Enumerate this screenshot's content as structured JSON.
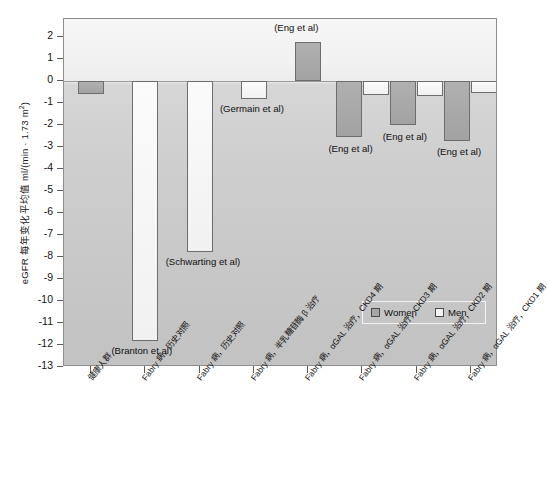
{
  "chart_data": {
    "type": "bar",
    "title": "",
    "xlabel": "",
    "ylabel": "eGFR 每年变化平均值 ml/(min · 1.73 m",
    "ylabel_sup": "2",
    "ylabel_tail": ")",
    "ylim": [
      -13,
      2.8
    ],
    "yticks": [
      2,
      1,
      0,
      -1,
      -2,
      -3,
      -4,
      -5,
      -6,
      -7,
      -8,
      -9,
      -10,
      -11,
      -12,
      -13
    ],
    "ytick_labels": [
      "2",
      "1",
      "0",
      "-1",
      "-2",
      "-3",
      "-4",
      "-5",
      "-6",
      "-7",
      "-8",
      "-9",
      "-10",
      "-11",
      "-12",
      "-13"
    ],
    "grid": false,
    "legend_position": "inside-lower-right",
    "categories": [
      "健康人群",
      "Fabry 病，历史对照",
      "Fabry 病，历史对照",
      "Fabry 病，半乳糖苷酶 β 治疗",
      "Fabry 病，αGAL 治疗，CKD4 期",
      "Fabry 病，αGAL 治疗，CKD3 期",
      "Fabry 病，αGAL 治疗，CKD2 期",
      "Fabry 病，αGAL 治疗，CKD1 期"
    ],
    "series": [
      {
        "name": "Women",
        "color": "#a6a6a6",
        "values": [
          -0.6,
          null,
          null,
          null,
          1.75,
          -2.55,
          -2.0,
          -2.75
        ]
      },
      {
        "name": "Men",
        "color": "#f4f4f4",
        "values": [
          null,
          -11.8,
          -7.8,
          -0.85,
          null,
          -0.65,
          -0.7,
          -0.55
        ]
      }
    ],
    "annotations": [
      {
        "text": "(Branton et al)",
        "category_index": 1,
        "value": -12.3
      },
      {
        "text": "(Schwarting et al)",
        "category_index": 2,
        "value": -8.3
      },
      {
        "text": "(Germain et al)",
        "category_index": 3,
        "value": -1.35
      },
      {
        "text": "(Eng et al)",
        "category_index": 4,
        "value": 2.35
      },
      {
        "text": "(Eng et al)",
        "category_index": 5,
        "value": -3.15
      },
      {
        "text": "(Eng et al)",
        "category_index": 6,
        "value": -2.6
      },
      {
        "text": "(Eng et al)",
        "category_index": 7,
        "value": -3.3
      }
    ],
    "legend": [
      {
        "label": "Women",
        "swatch": "women"
      },
      {
        "label": "Men",
        "swatch": "men"
      }
    ]
  }
}
